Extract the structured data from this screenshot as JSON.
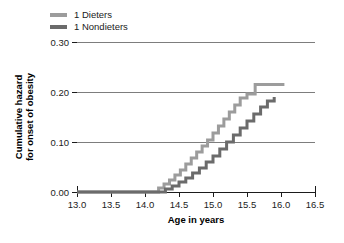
{
  "legend": {
    "position": "top-left",
    "entries": [
      {
        "label": "1 Dieters",
        "color": "#9c9c9c",
        "icon": "line-swatch"
      },
      {
        "label": "1 Nondieters",
        "color": "#6b6b6b",
        "icon": "line-swatch"
      }
    ]
  },
  "axes": {
    "xlabel": "Age in years",
    "ylabel_line1": "Cumulative hazard",
    "ylabel_line2": "for onset of obesity",
    "xticks": [
      "13.0",
      "13.5",
      "14.0",
      "14.5",
      "15.0",
      "15.5",
      "16.0",
      "16.5"
    ],
    "yticks": [
      "0.00",
      "0.10",
      "0.20",
      "0.30"
    ]
  },
  "chart_data": {
    "type": "line",
    "title": "",
    "xlabel": "Age in years",
    "ylabel": "Cumulative hazard for onset of obesity",
    "xlim": [
      13.0,
      16.5
    ],
    "ylim": [
      0.0,
      0.3
    ],
    "xticks": [
      13.0,
      13.5,
      14.0,
      14.5,
      15.0,
      15.5,
      16.0,
      16.5
    ],
    "yticks": [
      0.0,
      0.1,
      0.2,
      0.3
    ],
    "grid": "horizontal",
    "legend_position": "top-left",
    "interpolation": "step-post",
    "series": [
      {
        "name": "1 Dieters",
        "color": "#9c9c9c",
        "x": [
          13.0,
          14.1,
          14.2,
          14.28,
          14.36,
          14.44,
          14.52,
          14.6,
          14.68,
          14.76,
          14.84,
          14.92,
          15.0,
          15.08,
          15.16,
          15.24,
          15.32,
          15.4,
          15.5,
          15.62,
          16.05
        ],
        "y": [
          0.0,
          0.0,
          0.008,
          0.016,
          0.024,
          0.034,
          0.044,
          0.056,
          0.068,
          0.08,
          0.092,
          0.104,
          0.118,
          0.132,
          0.146,
          0.16,
          0.174,
          0.188,
          0.196,
          0.215,
          0.215
        ]
      },
      {
        "name": "1 Nondieters",
        "color": "#6b6b6b",
        "x": [
          13.0,
          14.18,
          14.3,
          14.4,
          14.5,
          14.6,
          14.7,
          14.8,
          14.9,
          15.0,
          15.1,
          15.2,
          15.3,
          15.4,
          15.5,
          15.6,
          15.7,
          15.8,
          15.9
        ],
        "y": [
          0.0,
          0.0,
          0.006,
          0.012,
          0.02,
          0.028,
          0.038,
          0.048,
          0.06,
          0.072,
          0.086,
          0.1,
          0.114,
          0.128,
          0.142,
          0.156,
          0.17,
          0.182,
          0.19
        ]
      }
    ]
  }
}
